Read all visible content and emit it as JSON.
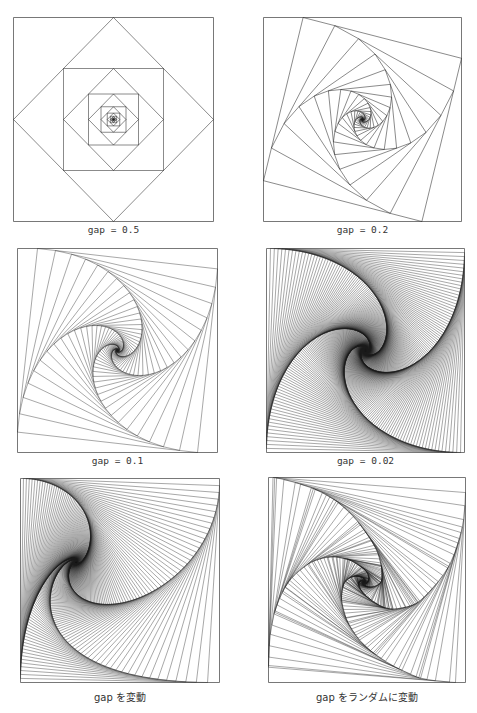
{
  "figure": {
    "panels": [
      {
        "caption": "gap = 0.5",
        "mode": "fixed",
        "gap": 0.5,
        "box": [
          13,
          17,
          201,
          205
        ],
        "captionY": 224,
        "mono": true,
        "iterations": 40
      },
      {
        "caption": "gap = 0.2",
        "mode": "fixed",
        "gap": 0.2,
        "box": [
          263,
          17,
          199,
          205
        ],
        "captionY": 224,
        "mono": true,
        "iterations": 70
      },
      {
        "caption": "gap = 0.1",
        "mode": "fixed",
        "gap": 0.1,
        "box": [
          17,
          248,
          201,
          205
        ],
        "captionY": 455,
        "mono": true,
        "iterations": 140
      },
      {
        "caption": "gap = 0.02",
        "mode": "fixed",
        "gap": 0.02,
        "box": [
          266,
          248,
          199,
          205
        ],
        "captionY": 455,
        "mono": true,
        "iterations": 600
      },
      {
        "caption": "gap を変動",
        "mode": "varying",
        "gaps": [
          0.015,
          0.035,
          0.06,
          0.02
        ],
        "box": [
          20,
          478,
          200,
          205
        ],
        "captionY": 689,
        "mono": false,
        "iterations": 360
      },
      {
        "caption": "gap をランダムに変動",
        "mode": "random",
        "gapRange": [
          0.005,
          0.08
        ],
        "seed": 7,
        "box": [
          268,
          477,
          198,
          206
        ],
        "captionY": 689,
        "mono": false,
        "iterations": 320
      }
    ],
    "stroke_color": "#1a1a1a",
    "frame_color": "#555555"
  }
}
